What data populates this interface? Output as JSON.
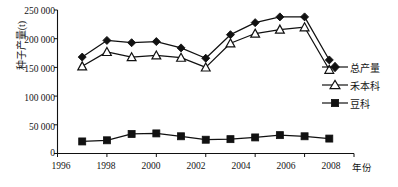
{
  "chart_data": {
    "type": "line",
    "title": "",
    "subtitle": "",
    "xlabel": "年份",
    "ylabel": "种子产量(t)",
    "x": [
      1997,
      1998,
      1999,
      2000,
      2001,
      2002,
      2003,
      2004,
      2005,
      2006,
      2007
    ],
    "xlim": [
      1996,
      2008
    ],
    "ylim": [
      0,
      250000
    ],
    "xticks": [
      "1996",
      "1998",
      "2000",
      "2002",
      "2004",
      "2006",
      "2008"
    ],
    "xtick_values": [
      1996,
      1998,
      2000,
      2002,
      2004,
      2006,
      2008
    ],
    "yticks": [
      "0",
      "50 000",
      "100 000",
      "150 000",
      "200 000",
      "250 000"
    ],
    "ytick_values": [
      0,
      50000,
      100000,
      150000,
      200000,
      250000
    ],
    "grid": false,
    "legend_position": "right",
    "series": [
      {
        "name": "总产量",
        "marker": "filled-diamond",
        "color": "#111111",
        "values": [
          168000,
          197000,
          193000,
          195000,
          184000,
          166000,
          207000,
          228000,
          238000,
          238000,
          163000
        ]
      },
      {
        "name": "禾本科",
        "marker": "open-triangle",
        "color": "#111111",
        "values": [
          152000,
          177000,
          168000,
          171000,
          167000,
          150000,
          192000,
          209000,
          216000,
          220000,
          146000
        ]
      },
      {
        "name": "豆科",
        "marker": "filled-square",
        "color": "#111111",
        "values": [
          21000,
          23000,
          34000,
          35000,
          30000,
          24000,
          25000,
          28000,
          32000,
          30000,
          26000
        ]
      }
    ]
  },
  "axes": {
    "y_title": "种子产量(t)",
    "x_title": "年份",
    "y_tick_labels": [
      "250 000",
      "200 000",
      "150 000",
      "100 000",
      "50 000",
      "0"
    ],
    "x_tick_labels": [
      "1996",
      "1998",
      "2000",
      "2002",
      "2004",
      "2006",
      "2008"
    ]
  },
  "legend": {
    "items": [
      {
        "label": "总产量",
        "marker": "filled-diamond"
      },
      {
        "label": "禾本科",
        "marker": "open-triangle"
      },
      {
        "label": "豆科",
        "marker": "filled-square"
      }
    ]
  },
  "colors": {
    "ink": "#111111",
    "background": "#ffffff"
  }
}
